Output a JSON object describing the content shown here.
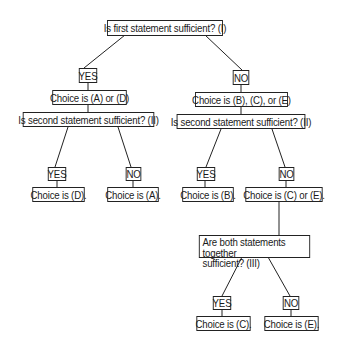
{
  "diagram": {
    "type": "decision-tree",
    "nodes": {
      "q1": "Is first statement sufficient? (I)",
      "q1_yes": "YES",
      "q1_no": "NO",
      "choice_ad": "Choice is (A) or (D)",
      "choice_bce": "Choice is (B), (C), or (E)",
      "q2_left": "Is second statement sufficient? (II)",
      "q2_right": "Is second statement sufficient? (II)",
      "q2_left_yes": "YES",
      "q2_left_no": "NO",
      "q2_right_yes": "YES",
      "q2_right_no": "NO",
      "choice_d": "Choice is (D).",
      "choice_a": "Choice is (A).",
      "choice_b": "Choice is (B).",
      "choice_ce": "Choice is (C) or (E).",
      "q3_line1": "Are both statements together",
      "q3_line2": "sufficient? (III)",
      "q3_yes": "YES",
      "q3_no": "NO",
      "choice_c": "Choice is (C).",
      "choice_e": "Choice is (E)."
    },
    "edges": [
      [
        "q1",
        "q1_yes"
      ],
      [
        "q1",
        "q1_no"
      ],
      [
        "q1_yes",
        "choice_ad"
      ],
      [
        "q1_no",
        "choice_bce"
      ],
      [
        "choice_ad",
        "q2_left"
      ],
      [
        "choice_bce",
        "q2_right"
      ],
      [
        "q2_left",
        "q2_left_yes"
      ],
      [
        "q2_left",
        "q2_left_no"
      ],
      [
        "q2_right",
        "q2_right_yes"
      ],
      [
        "q2_right",
        "q2_right_no"
      ],
      [
        "q2_left_yes",
        "choice_d"
      ],
      [
        "q2_left_no",
        "choice_a"
      ],
      [
        "q2_right_yes",
        "choice_b"
      ],
      [
        "q2_right_no",
        "choice_ce"
      ],
      [
        "choice_ce",
        "q3"
      ],
      [
        "q3",
        "q3_yes"
      ],
      [
        "q3",
        "q3_no"
      ],
      [
        "q3_yes",
        "choice_c"
      ],
      [
        "q3_no",
        "choice_e"
      ]
    ]
  }
}
